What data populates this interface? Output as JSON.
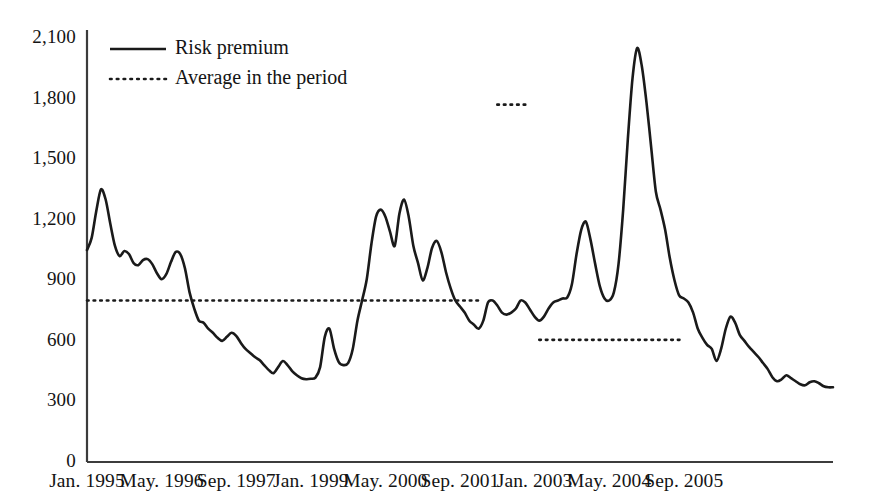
{
  "chart_data": {
    "type": "line",
    "title": "",
    "xlabel": "",
    "ylabel": "",
    "ylim": [
      0,
      2100
    ],
    "yticks": [
      0,
      300,
      600,
      900,
      1200,
      1500,
      1800,
      2100
    ],
    "ytick_labels": [
      "0",
      "300",
      "600",
      "900",
      "1,200",
      "1,500",
      "1,800",
      "2,100"
    ],
    "xtick_labels": [
      "Jan. 1995",
      "May. 1996",
      "Sep. 1997",
      "Jan. 1999",
      "May. 2000",
      "Sep. 2001",
      "Jan. 2003",
      "May. 2004",
      "Sep. 2005"
    ],
    "xtick_index": [
      0,
      16,
      32,
      48,
      64,
      80,
      96,
      112,
      128
    ],
    "grid": false,
    "legend_position": "top-left",
    "legend": [
      {
        "label": "Risk premium",
        "style": "solid"
      },
      {
        "label": "Average in the period",
        "style": "dotted"
      }
    ],
    "series": [
      {
        "name": "Risk premium",
        "style": "solid",
        "x_start": "Jan. 1995",
        "x_end": "Sep. 2005",
        "n_points": 129,
        "values": [
          1050,
          1110,
          1245,
          1350,
          1300,
          1180,
          1070,
          1020,
          1045,
          1030,
          985,
          975,
          1000,
          1005,
          980,
          935,
          905,
          930,
          990,
          1040,
          1030,
          960,
          840,
          760,
          700,
          690,
          660,
          640,
          615,
          600,
          620,
          640,
          625,
          590,
          560,
          540,
          520,
          505,
          480,
          455,
          440,
          470,
          500,
          480,
          450,
          430,
          415,
          410,
          412,
          418,
          470,
          620,
          660,
          560,
          495,
          480,
          490,
          560,
          700,
          800,
          905,
          1080,
          1215,
          1250,
          1215,
          1140,
          1070,
          1230,
          1300,
          1215,
          1070,
          985,
          900,
          960,
          1060,
          1095,
          1040,
          940,
          860,
          800,
          770,
          740,
          700,
          680,
          660,
          700,
          790,
          800,
          775,
          740,
          730,
          740,
          760,
          800,
          790,
          755,
          720,
          700,
          720,
          760,
          790,
          800,
          810,
          815,
          880,
          1030,
          1150,
          1190,
          1100,
          980,
          870,
          810,
          800,
          840,
          980,
          1250,
          1600,
          1900,
          2050,
          1960,
          1780,
          1560,
          1340,
          1250,
          1150,
          1010,
          900,
          825,
          810,
          790,
          740,
          660,
          615,
          580,
          560,
          500,
          560,
          660,
          720,
          690,
          630,
          600,
          570,
          545,
          520,
          490,
          460,
          420,
          400,
          410,
          430,
          415,
          400,
          385,
          380,
          395,
          400,
          390,
          375,
          370,
          370
        ]
      }
    ],
    "average_segments": [
      {
        "label": "Average in the period",
        "value": 800,
        "start_index": 0,
        "end_index": 84
      },
      {
        "label": "Average in the period",
        "value": 1770,
        "start_index": 88,
        "end_index": 94
      },
      {
        "label": "Average in the period",
        "value": 605,
        "start_index": 97,
        "end_index": 128
      }
    ],
    "colors": {
      "line": "#1a1a1a",
      "average": "#1a1a1a",
      "axis": "#3c3c3c",
      "background": "#ffffff"
    }
  },
  "axes": {
    "y_axis_name": "value-axis",
    "x_axis_name": "time-axis"
  }
}
